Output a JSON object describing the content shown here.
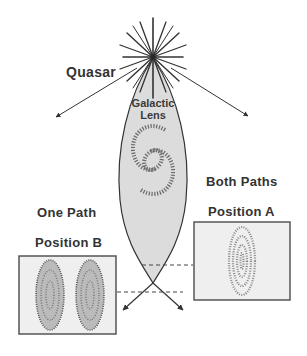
{
  "diagram": {
    "labels": {
      "quasar": "Quasar",
      "lens_line1": "Galactic",
      "lens_line2": "Lens",
      "both_paths": "Both Paths",
      "position_a": "Position A",
      "one_path": "One Path",
      "position_b": "Position B"
    },
    "panels": [
      {
        "name": "Position A",
        "caption": "Both Paths",
        "image": "single-ring-image"
      },
      {
        "name": "Position B",
        "caption": "One Path",
        "image": "double-image"
      }
    ],
    "colors": {
      "lens_fill": "#dcdcdc",
      "line": "#333333",
      "panel_fill": "#efefef",
      "panel_border": "#555555",
      "text": "#333333"
    }
  }
}
